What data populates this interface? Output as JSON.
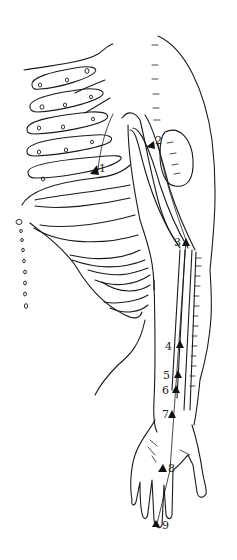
{
  "figure": {
    "points": [
      {
        "label": "1",
        "x": 97,
        "y": 172
      },
      {
        "label": "2",
        "x": 155,
        "y": 145
      },
      {
        "label": "3",
        "x": 186,
        "y": 242
      },
      {
        "label": "4",
        "x": 180,
        "y": 344
      },
      {
        "label": "5",
        "x": 178,
        "y": 374
      },
      {
        "label": "6",
        "x": 176,
        "y": 389
      },
      {
        "label": "7",
        "x": 172,
        "y": 415
      },
      {
        "label": "8",
        "x": 163,
        "y": 468
      },
      {
        "label": "9",
        "x": 156,
        "y": 524
      }
    ],
    "colors": {
      "line": "#1a1a1a",
      "background": "#ffffff"
    }
  }
}
